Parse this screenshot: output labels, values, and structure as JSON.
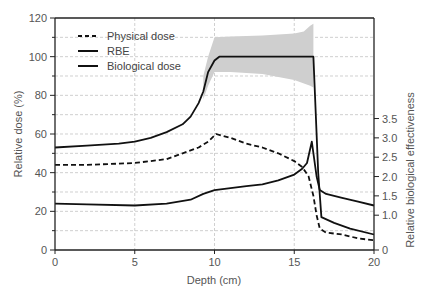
{
  "chart_data": {
    "type": "line",
    "title": "",
    "xlabel": "Depth (cm)",
    "ylabel": "Relative dose (%)",
    "y2label": "Relative biological effectiveness",
    "xlim": [
      0,
      20
    ],
    "ylim": [
      0,
      120
    ],
    "xticks": [
      0,
      5,
      10,
      15,
      20
    ],
    "yticks": [
      0,
      20,
      40,
      60,
      80,
      100,
      120
    ],
    "y2ticks": [
      {
        "label": "0",
        "value": 0,
        "left_equiv": 0
      },
      {
        "label": "1.0",
        "value": 1.0,
        "left_equiv": 18
      },
      {
        "label": "1.5",
        "value": 1.5,
        "left_equiv": 28
      },
      {
        "label": "2.0",
        "value": 2.0,
        "left_equiv": 38
      },
      {
        "label": "2.5",
        "value": 2.5,
        "left_equiv": 48
      },
      {
        "label": "3.0",
        "value": 3.0,
        "left_equiv": 58
      },
      {
        "label": "3.5",
        "value": 3.5,
        "left_equiv": 68
      }
    ],
    "grid": true,
    "legend_position": "upper left",
    "series": [
      {
        "name": "Physical dose",
        "style": "dashed",
        "axis": "left",
        "x": [
          0,
          2,
          5,
          7,
          8,
          9,
          9.6,
          10.1,
          11,
          12,
          13,
          14,
          15,
          15.5,
          15.9,
          16.2,
          16.4,
          16.6,
          17,
          18,
          19,
          20
        ],
        "y": [
          44,
          44,
          45,
          47,
          50,
          53,
          56,
          60,
          58,
          55,
          53,
          50,
          46,
          43,
          38,
          28,
          18,
          11,
          9,
          8,
          6,
          5
        ]
      },
      {
        "name": "RBE",
        "style": "solid",
        "axis": "right",
        "x": [
          0,
          2,
          5,
          7,
          8.5,
          9.3,
          10,
          11,
          12,
          13,
          14,
          15,
          15.5,
          15.8,
          16.1,
          16.4,
          16.6,
          17,
          18,
          19,
          20
        ],
        "y": [
          1.3,
          1.28,
          1.25,
          1.3,
          1.4,
          1.55,
          1.65,
          1.7,
          1.75,
          1.8,
          1.9,
          2.05,
          2.2,
          2.35,
          2.9,
          2.0,
          1.65,
          1.55,
          1.45,
          1.35,
          1.25
        ]
      },
      {
        "name": "Biological dose",
        "style": "solid",
        "axis": "left",
        "x": [
          0,
          2,
          4,
          5,
          6,
          7,
          8,
          8.5,
          9,
          9.3,
          9.6,
          10,
          10.3,
          13,
          15,
          16.2,
          16.5,
          16.7,
          17.5,
          18.5,
          20
        ],
        "y": [
          53,
          54,
          55,
          56,
          58,
          61,
          65,
          69,
          76,
          82,
          92,
          98,
          100,
          100,
          100,
          100,
          40,
          17,
          14,
          11,
          8
        ]
      }
    ],
    "uncertainty_band": {
      "series": "Biological dose",
      "upper": {
        "x": [
          9.3,
          9.6,
          10,
          11,
          13,
          15,
          15.6,
          16.0,
          16.2
        ],
        "y": [
          90,
          100,
          110,
          110.5,
          111,
          112,
          113,
          116,
          117
        ]
      },
      "lower": {
        "x": [
          16.2,
          16.0,
          15,
          13,
          11,
          10,
          9.6,
          9.3
        ],
        "y": [
          84,
          85,
          88,
          91,
          92,
          92,
          85,
          78
        ]
      }
    }
  },
  "legend": {
    "items": [
      {
        "label": "Physical dose",
        "style": "dashed"
      },
      {
        "label": "RBE",
        "style": "solid"
      },
      {
        "label": "Biological dose",
        "style": "solid"
      }
    ]
  },
  "axes": {
    "x_title": "Depth (cm)",
    "y_title": "Relative dose (%)",
    "y2_title": "Relative biological effectiveness"
  },
  "colors": {
    "line": "#111111",
    "grid": "#bbbbbb",
    "band": "#cfcfcf",
    "axis": "#222222",
    "text": "#555555"
  }
}
